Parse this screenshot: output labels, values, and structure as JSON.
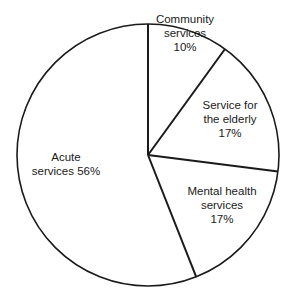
{
  "chart_data": {
    "type": "pie",
    "title": "",
    "center": [
      148,
      155
    ],
    "radius": 131,
    "start_angle_deg": -90,
    "direction": "clockwise",
    "slices": [
      {
        "label": "Community services",
        "value": 10,
        "label_lines": [
          "Community",
          "services",
          "10%"
        ],
        "label_pos": [
          185,
          12
        ]
      },
      {
        "label": "Service for the elderly",
        "value": 17,
        "label_lines": [
          "Service for",
          "the elderly",
          "17%"
        ],
        "label_pos": [
          230,
          98
        ]
      },
      {
        "label": "Mental health services",
        "value": 17,
        "label_lines": [
          "Mental health",
          "services",
          "17%"
        ],
        "label_pos": [
          222,
          184
        ]
      },
      {
        "label": "Acute services",
        "value": 56,
        "label_lines": [
          "Acute",
          "services 56%"
        ],
        "label_pos": [
          66,
          150
        ]
      }
    ],
    "colors": {
      "fill": "#ffffff",
      "stroke": "#1a1a1a"
    }
  }
}
